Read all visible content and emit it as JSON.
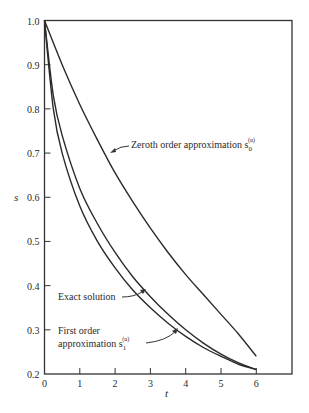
{
  "chart_data": {
    "type": "line",
    "title": "",
    "xlabel": "t",
    "ylabel": "s",
    "xlim": [
      0,
      6.7
    ],
    "ylim": [
      0.2,
      1.0
    ],
    "grid": false,
    "legend": "none (curves labeled directly with annotations)",
    "x_ticks": [
      0,
      1,
      2,
      3,
      4,
      5,
      6
    ],
    "y_ticks": [
      0.2,
      0.3,
      0.4,
      0.5,
      0.6,
      0.7,
      0.8,
      0.9,
      1.0
    ],
    "x_tick_labels": [
      "0",
      "1",
      "2",
      "3",
      "4",
      "5",
      "6"
    ],
    "y_tick_labels": [
      "0.2",
      "0.3",
      "0.4",
      "0.5",
      "0.6",
      "0.7",
      "0.8",
      "0.9",
      "1.0"
    ],
    "series": [
      {
        "name": "Zeroth order approximation s0(u)",
        "x": [
          0,
          0.5,
          1,
          1.5,
          2,
          2.5,
          3,
          3.5,
          4,
          4.5,
          5,
          5.5,
          6
        ],
        "values": [
          1.0,
          0.9,
          0.81,
          0.73,
          0.655,
          0.59,
          0.53,
          0.475,
          0.425,
          0.38,
          0.335,
          0.29,
          0.24
        ]
      },
      {
        "name": "Exact solution",
        "x": [
          0,
          0.25,
          0.5,
          1,
          1.5,
          2,
          2.5,
          3,
          3.5,
          4,
          4.5,
          5,
          5.5,
          6
        ],
        "values": [
          1.0,
          0.83,
          0.74,
          0.62,
          0.54,
          0.475,
          0.42,
          0.375,
          0.335,
          0.3,
          0.27,
          0.245,
          0.225,
          0.21
        ]
      },
      {
        "name": "First order approximation s1(u)",
        "x": [
          0,
          0.25,
          0.5,
          1,
          1.5,
          2,
          2.5,
          3,
          3.5,
          4,
          4.5,
          5,
          5.5,
          6
        ],
        "values": [
          1.0,
          0.8,
          0.7,
          0.58,
          0.5,
          0.44,
          0.39,
          0.35,
          0.315,
          0.285,
          0.26,
          0.24,
          0.222,
          0.21
        ]
      }
    ],
    "annotations": [
      {
        "text": "Zeroth order approximation s",
        "sub": "0",
        "sup": "(u)",
        "points_to": "Zeroth order approximation s0(u)"
      },
      {
        "text": "Exact solution",
        "points_to": "Exact solution"
      },
      {
        "text_line1": "First order",
        "text_line2": "approximation s",
        "sub": "1",
        "sup": "(u)",
        "points_to": "First order approximation s1(u)"
      }
    ]
  }
}
